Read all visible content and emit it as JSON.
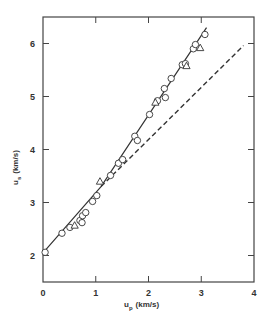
{
  "chart_data": {
    "type": "scatter",
    "title": "",
    "xlabel": "u_p (km/s)",
    "ylabel": "u_s (km/s)",
    "xlabel_main": "u",
    "xlabel_sub": "p",
    "xlabel_units": "(km/s)",
    "ylabel_main": "u",
    "ylabel_sub": "s",
    "ylabel_units": "(km/s)",
    "xlim": [
      0,
      4
    ],
    "ylim": [
      1.5,
      6.5
    ],
    "xticks": [
      0,
      1,
      2,
      3,
      4
    ],
    "yticks": [
      2,
      3,
      4,
      5,
      6
    ],
    "xtick_labels": [
      "0",
      "1",
      "2",
      "3",
      "4"
    ],
    "ytick_labels": [
      "2",
      "3",
      "4",
      "5",
      "6"
    ],
    "grid": false,
    "legend": null,
    "series": [
      {
        "name": "circles",
        "marker": "circle",
        "points": [
          [
            0.04,
            2.06
          ],
          [
            0.36,
            2.42
          ],
          [
            0.51,
            2.53
          ],
          [
            0.7,
            2.66
          ],
          [
            0.74,
            2.62
          ],
          [
            0.75,
            2.75
          ],
          [
            0.81,
            2.81
          ],
          [
            0.94,
            3.02
          ],
          [
            1.02,
            3.13
          ],
          [
            1.28,
            3.51
          ],
          [
            1.43,
            3.74
          ],
          [
            1.51,
            3.81
          ],
          [
            1.74,
            4.25
          ],
          [
            1.79,
            4.17
          ],
          [
            2.02,
            4.66
          ],
          [
            2.17,
            4.92
          ],
          [
            2.3,
            5.15
          ],
          [
            2.32,
            4.98
          ],
          [
            2.43,
            5.34
          ],
          [
            2.64,
            5.6
          ],
          [
            2.7,
            5.62
          ],
          [
            2.85,
            5.9
          ],
          [
            2.89,
            5.98
          ],
          [
            3.07,
            6.17
          ]
        ]
      },
      {
        "name": "triangles",
        "marker": "triangle",
        "points": [
          [
            0.6,
            2.57
          ],
          [
            1.08,
            3.4
          ],
          [
            2.13,
            4.89
          ],
          [
            2.72,
            5.58
          ],
          [
            2.98,
            5.92
          ]
        ]
      }
    ],
    "lines": [
      {
        "name": "solid-fit",
        "style": "solid",
        "points": [
          [
            0.0,
            2.05
          ],
          [
            1.1,
            3.3
          ],
          [
            3.1,
            6.3
          ]
        ]
      },
      {
        "name": "dashed-extrapolation",
        "style": "dashed",
        "points": [
          [
            1.1,
            3.3
          ],
          [
            3.8,
            5.96
          ]
        ]
      }
    ],
    "colors": {
      "ink": "#333333",
      "marker_fill": "#ffffff"
    }
  }
}
